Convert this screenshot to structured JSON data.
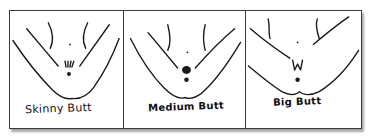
{
  "figure": {
    "type": "three-panel hand-drawn comparison",
    "panels": [
      {
        "id": "skinny",
        "caption": "Skinny Butt"
      },
      {
        "id": "medium",
        "caption": "Medium Butt"
      },
      {
        "id": "big",
        "caption": "Big Butt"
      }
    ]
  },
  "colors": {
    "ink": "#1a1a1a",
    "frame": "#3a3a3a",
    "background": "#ffffff"
  }
}
